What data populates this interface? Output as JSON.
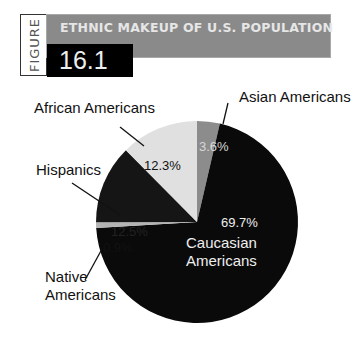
{
  "figure": {
    "label": "FIGURE",
    "number": "16.1",
    "title": "ETHNIC MAKEUP OF U.S. POPULATION"
  },
  "chart_data": {
    "type": "pie",
    "title": "ETHNIC MAKEUP OF U.S. POPULATION",
    "start_angle": "12 o'clock, clockwise",
    "slices": [
      {
        "name": "Asian Americans",
        "value": 3.6,
        "label": "3.6%",
        "color": "#8c8c8c"
      },
      {
        "name": "Caucasian Americans",
        "value": 69.7,
        "label": "69.7%",
        "color": "#0a0a0a"
      },
      {
        "name": "Native Americans",
        "value": 0.9,
        "label": "0.9%",
        "color": "#b4b4b4"
      },
      {
        "name": "Hispanics",
        "value": 12.5,
        "label": "12.5%",
        "color": "#151515"
      },
      {
        "name": "African Americans",
        "value": 12.3,
        "label": "12.3%",
        "color": "#e0e0e0"
      }
    ]
  },
  "labels": {
    "asian": "Asian Americans",
    "african": "African Americans",
    "hispanics": "Hispanics",
    "native_1": "Native",
    "native_2": "Americans",
    "caucasian_1": "Caucasian",
    "caucasian_2": "Americans",
    "pct_asian": "3.6%",
    "pct_african": "12.3%",
    "pct_hispanics": "12.5%",
    "pct_native": "0.9%",
    "pct_caucasian": "69.7%"
  }
}
